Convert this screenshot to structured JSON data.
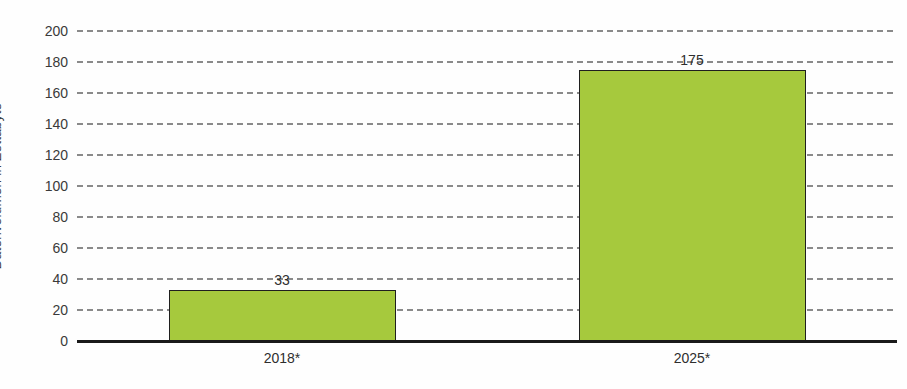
{
  "chart_data": {
    "type": "bar",
    "title": "",
    "categories": [
      "2018*",
      "2025*"
    ],
    "values": [
      33,
      175
    ],
    "value_labels": [
      "33",
      "175"
    ],
    "xlabel": "",
    "ylabel": "Datenvolumen in Zettabyte",
    "ylim": [
      0,
      200
    ],
    "yticks": [
      0,
      20,
      40,
      60,
      80,
      100,
      120,
      140,
      160,
      180,
      200
    ],
    "grid": "dashed horizontal",
    "legend": "none",
    "bar_color": "#a6c93d",
    "bar_border_color": "#1f1f1f",
    "axis_color": "#1a1a1a",
    "grid_color": "#8a8a8a",
    "text_color": "#2e2e2e"
  }
}
